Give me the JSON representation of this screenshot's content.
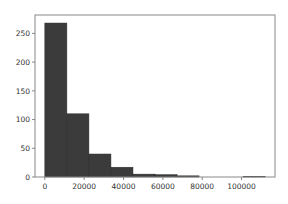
{
  "chart_data": {
    "type": "bar",
    "subtype": "histogram",
    "title": "",
    "xlabel": "",
    "ylabel": "",
    "bin_edges": [
      0,
      11200,
      22400,
      33600,
      44800,
      56000,
      67200,
      78400,
      89600,
      100800,
      112000
    ],
    "categories": [
      "0-11200",
      "11200-22400",
      "22400-33600",
      "33600-44800",
      "44800-56000",
      "56000-67200",
      "67200-78400",
      "78400-89600",
      "89600-100800",
      "100800-112000"
    ],
    "values": [
      268,
      110,
      40,
      17,
      5,
      4,
      2,
      0,
      0,
      1
    ],
    "xlim": [
      -5000,
      117000
    ],
    "ylim": [
      0,
      282
    ],
    "xticks": [
      0,
      20000,
      40000,
      60000,
      80000,
      100000
    ],
    "xtick_labels": [
      "0",
      "20000",
      "40000",
      "60000",
      "80000",
      "100000"
    ],
    "yticks": [
      0,
      50,
      100,
      150,
      200,
      250
    ],
    "ytick_labels": [
      "0",
      "50",
      "100",
      "150",
      "200",
      "250"
    ],
    "grid": false,
    "legend": null,
    "colors": {
      "bar": "#3b3b3b",
      "bar_edge": "#2a2a2a",
      "axis": "#888888",
      "text": "#333333"
    }
  }
}
